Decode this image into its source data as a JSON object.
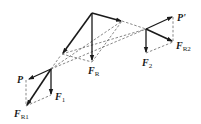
{
  "diagram": {
    "colors": {
      "stroke": "#1a1a1a",
      "dashed": "#555555",
      "background": "#ffffff"
    },
    "labels": {
      "P": {
        "main": "F",
        "text": "P"
      },
      "F1": {
        "main": "F",
        "sub": "1"
      },
      "FR1": {
        "main": "F",
        "sub": "R1"
      },
      "FR": {
        "main": "F",
        "sub": "R"
      },
      "F2": {
        "main": "F",
        "sub": "2"
      },
      "P_prime": {
        "text": "P'"
      },
      "FR2": {
        "main": "F",
        "sub": "R2"
      }
    }
  }
}
